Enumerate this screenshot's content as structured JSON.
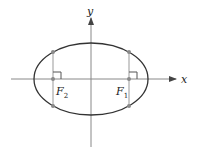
{
  "diagram": {
    "axes": {
      "x_label": "x",
      "y_label": "y"
    },
    "foci": [
      {
        "name": "F2",
        "label_main": "F",
        "label_sub": "2"
      },
      {
        "name": "F1",
        "label_main": "F",
        "label_sub": "1"
      }
    ],
    "colors": {
      "ellipse": "#333333",
      "axes": "#888888",
      "latus_rectum": "#999999",
      "points": "#8a8a8a"
    }
  }
}
